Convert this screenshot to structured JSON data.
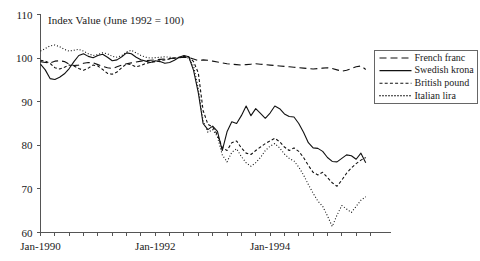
{
  "chart_data": {
    "type": "line",
    "title": "Index Value (June 1992 = 100)",
    "xlabel": "",
    "ylabel": "",
    "ylim": [
      60,
      110
    ],
    "yticks": [
      60,
      70,
      80,
      90,
      100,
      110
    ],
    "ytick_labels": [
      "60",
      "70",
      "80",
      "90",
      "100",
      "110"
    ],
    "xlim": [
      1990.0,
      1995.75
    ],
    "xticks": [
      1990.0,
      1992.0,
      1994.0
    ],
    "xtick_labels": [
      "Jan-1990",
      "Jan-1992",
      "Jan-1994"
    ],
    "grid": false,
    "legend_position": "right",
    "x": [
      1990.0,
      1990.083,
      1990.167,
      1990.25,
      1990.333,
      1990.417,
      1990.5,
      1990.583,
      1990.667,
      1990.75,
      1990.833,
      1990.917,
      1991.0,
      1991.083,
      1991.167,
      1991.25,
      1991.333,
      1991.417,
      1991.5,
      1991.583,
      1991.667,
      1991.75,
      1991.833,
      1991.917,
      1992.0,
      1992.083,
      1992.167,
      1992.25,
      1992.333,
      1992.417,
      1992.5,
      1992.583,
      1992.667,
      1992.75,
      1992.833,
      1992.917,
      1993.0,
      1993.083,
      1993.167,
      1993.25,
      1993.333,
      1993.417,
      1993.5,
      1993.583,
      1993.667,
      1993.75,
      1993.833,
      1993.917,
      1994.0,
      1994.083,
      1994.167,
      1994.25,
      1994.333,
      1994.417,
      1994.5,
      1994.583,
      1994.667,
      1994.75,
      1994.833,
      1994.917,
      1995.0,
      1995.083,
      1995.167,
      1995.25,
      1995.333,
      1995.417,
      1995.5,
      1995.583,
      1995.667
    ],
    "series": [
      {
        "name": "French franc",
        "style": "dashed",
        "values": [
          99.2,
          99.0,
          98.9,
          99.3,
          99.4,
          99.2,
          98.6,
          98.3,
          98.4,
          98.8,
          99.0,
          98.9,
          98.5,
          98.1,
          97.8,
          97.6,
          98.0,
          98.4,
          98.7,
          98.9,
          99.1,
          99.3,
          99.4,
          99.5,
          99.6,
          99.7,
          99.8,
          99.9,
          100.0,
          100.1,
          100.2,
          100.1,
          99.8,
          99.4,
          99.6,
          99.5,
          99.3,
          99.1,
          98.9,
          98.7,
          98.6,
          98.5,
          98.4,
          98.5,
          98.6,
          98.7,
          98.6,
          98.5,
          98.4,
          98.3,
          98.2,
          98.1,
          98.0,
          97.9,
          97.8,
          97.7,
          97.6,
          97.5,
          97.6,
          97.7,
          97.8,
          97.6,
          97.3,
          97.0,
          97.2,
          97.6,
          98.0,
          98.2,
          97.4
        ]
      },
      {
        "name": "Swedish krona",
        "style": "solid",
        "values": [
          98.6,
          97.3,
          95.3,
          95.1,
          95.6,
          96.4,
          97.6,
          99.2,
          100.6,
          101.0,
          100.4,
          100.1,
          100.6,
          100.9,
          100.2,
          99.4,
          99.6,
          100.3,
          101.2,
          101.0,
          100.2,
          99.6,
          99.3,
          99.0,
          99.4,
          99.2,
          98.8,
          99.0,
          99.5,
          100.2,
          100.6,
          100.3,
          97.2,
          92.0,
          85.0,
          83.6,
          84.4,
          83.2,
          78.8,
          83.1,
          85.4,
          85.0,
          86.8,
          89.0,
          86.8,
          88.4,
          87.3,
          86.2,
          87.4,
          89.0,
          88.4,
          87.2,
          86.6,
          86.5,
          85.0,
          83.0,
          80.6,
          79.4,
          79.3,
          78.6,
          77.2,
          76.3,
          76.2,
          77.0,
          77.8,
          77.6,
          76.8,
          78.2,
          76.0
        ]
      },
      {
        "name": "British pound",
        "style": "short-dashed",
        "values": [
          99.5,
          99.3,
          98.8,
          97.8,
          97.5,
          97.9,
          98.4,
          98.2,
          97.6,
          97.2,
          97.7,
          98.4,
          98.2,
          97.4,
          96.5,
          96.3,
          96.8,
          97.8,
          98.7,
          98.5,
          98.0,
          98.3,
          98.8,
          99.0,
          99.2,
          99.4,
          99.6,
          99.8,
          100.0,
          100.2,
          100.4,
          100.3,
          99.2,
          96.6,
          88.0,
          84.8,
          84.2,
          82.4,
          79.5,
          78.8,
          80.6,
          81.0,
          79.4,
          78.2,
          77.9,
          78.8,
          79.6,
          80.4,
          81.0,
          81.6,
          80.8,
          79.6,
          78.8,
          79.4,
          78.6,
          77.2,
          75.4,
          73.8,
          73.2,
          73.8,
          72.6,
          71.4,
          70.6,
          72.0,
          73.6,
          74.8,
          75.8,
          76.6,
          77.2
        ]
      },
      {
        "name": "Italian lira",
        "style": "dotted",
        "values": [
          101.6,
          102.2,
          102.8,
          103.0,
          102.6,
          102.0,
          101.6,
          101.8,
          102.0,
          101.6,
          101.0,
          100.6,
          100.8,
          101.2,
          101.0,
          100.4,
          100.2,
          100.6,
          101.4,
          101.8,
          101.2,
          100.6,
          100.2,
          100.0,
          100.1,
          100.2,
          100.3,
          100.2,
          100.0,
          100.1,
          100.3,
          100.0,
          98.2,
          93.0,
          85.6,
          83.0,
          83.6,
          82.0,
          77.8,
          76.2,
          78.4,
          79.2,
          77.4,
          76.0,
          75.2,
          76.0,
          77.2,
          78.8,
          79.8,
          80.4,
          79.4,
          78.0,
          77.0,
          76.4,
          75.0,
          73.2,
          71.0,
          69.0,
          67.2,
          66.0,
          63.8,
          61.4,
          64.0,
          66.2,
          65.4,
          64.6,
          66.0,
          67.4,
          68.2
        ]
      }
    ]
  },
  "legend": {
    "items": [
      {
        "label": "French franc"
      },
      {
        "label": "Swedish krona"
      },
      {
        "label": "British pound"
      },
      {
        "label": "Italian lira"
      }
    ]
  }
}
